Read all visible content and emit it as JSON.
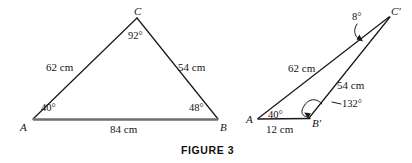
{
  "figure": {
    "caption": "FIGURE 3",
    "colors": {
      "base_line": "#6f6f6f",
      "triangle_side": "#1a1a1a",
      "text": "#141414",
      "background": "#ffffff"
    },
    "left_triangle": {
      "name": "triangle-ABC",
      "vertices": [
        {
          "key": "A",
          "label": "A",
          "x": 33,
          "y": 119
        },
        {
          "key": "B",
          "label": "B",
          "x": 218,
          "y": 119
        },
        {
          "key": "C",
          "label": "C",
          "x": 137,
          "y": 18
        }
      ],
      "angles": [
        {
          "at": "A",
          "label": "40°"
        },
        {
          "at": "B",
          "label": "48°"
        },
        {
          "at": "C",
          "label": "92°"
        }
      ],
      "sides": [
        {
          "between": "A-C",
          "label": "62 cm"
        },
        {
          "between": "C-B",
          "label": "54 cm"
        },
        {
          "between": "A-B",
          "label": "84 cm"
        }
      ]
    },
    "right_triangle": {
      "name": "triangle-ABprimeCprime",
      "vertices": [
        {
          "key": "A",
          "label": "A",
          "x": 258,
          "y": 119
        },
        {
          "key": "Bprime",
          "label": "B'",
          "x": 310,
          "y": 118
        },
        {
          "key": "Cprime",
          "label": "C'",
          "x": 390,
          "y": 14
        }
      ],
      "angles": [
        {
          "at": "A",
          "label": "40°"
        },
        {
          "at": "Bprime",
          "label": "132°"
        },
        {
          "at": "Cprime",
          "label": "8°"
        }
      ],
      "sides": [
        {
          "between": "A-Cprime",
          "label": "62 cm"
        },
        {
          "between": "Bprime-Cprime",
          "label": "54 cm"
        },
        {
          "between": "A-Bprime",
          "label": "12 cm"
        }
      ]
    }
  }
}
